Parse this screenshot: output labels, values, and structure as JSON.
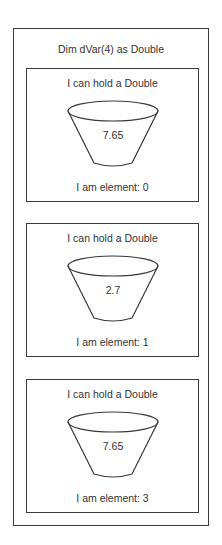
{
  "array": {
    "declaration": "Dim dVar(4) as Double",
    "elements": [
      {
        "title": "I can hold a Double",
        "value": "7.65",
        "label": "I am element: 0"
      },
      {
        "title": "I can hold a Double",
        "value": "2.7",
        "label": "I am element: 1"
      },
      {
        "title": "I can hold a Double",
        "value": "7.65",
        "label": "I am element: 3"
      }
    ]
  },
  "colors": {
    "stroke": "#3a3a3a",
    "text": "#333333",
    "background": "#ffffff"
  }
}
